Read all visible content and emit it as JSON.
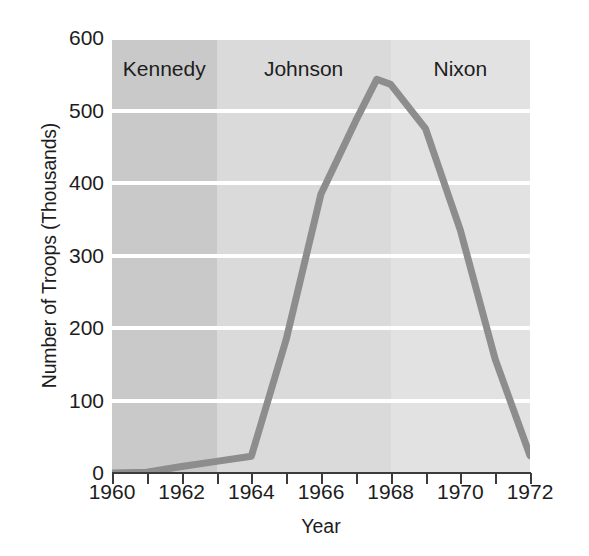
{
  "chart_data": {
    "type": "line",
    "title": "",
    "xlabel": "Year",
    "ylabel": "Number of Troops (Thousands)",
    "xlim": [
      1960,
      1972
    ],
    "ylim": [
      0,
      600
    ],
    "grid": true,
    "legend": "none",
    "line_color": "#8d8d8d",
    "x": [
      1960,
      1961,
      1962,
      1963,
      1964,
      1965,
      1966,
      1967,
      1967.6,
      1968,
      1969,
      1970,
      1971,
      1972
    ],
    "values": [
      0,
      1,
      9,
      16,
      23,
      184,
      385,
      486,
      543,
      536,
      475,
      335,
      157,
      24
    ],
    "series": [
      {
        "name": "U.S. troops in Vietnam",
        "values": [
          0,
          1,
          9,
          16,
          23,
          184,
          385,
          486,
          543,
          536,
          475,
          335,
          157,
          24
        ]
      }
    ],
    "xticks": [
      1960,
      1961,
      1962,
      1963,
      1964,
      1965,
      1966,
      1967,
      1968,
      1969,
      1970,
      1971,
      1972
    ],
    "xticklabels": [
      "1960",
      "",
      "1962",
      "",
      "1964",
      "",
      "1966",
      "",
      "1968",
      "",
      "1970",
      "",
      "1972"
    ],
    "yticks": [
      0,
      100,
      200,
      300,
      400,
      500,
      600
    ],
    "yticklabels": [
      "0",
      "100",
      "200",
      "300",
      "400",
      "500",
      "600"
    ],
    "annotations": [
      {
        "label": "Kennedy",
        "start": 1960,
        "end": 1963.0,
        "color": "#c9c9c9"
      },
      {
        "label": "Johnson",
        "start": 1963.0,
        "end": 1968.0,
        "color": "#dadada"
      },
      {
        "label": "Nixon",
        "start": 1968.0,
        "end": 1972.0,
        "color": "#e2e2e2"
      }
    ]
  }
}
